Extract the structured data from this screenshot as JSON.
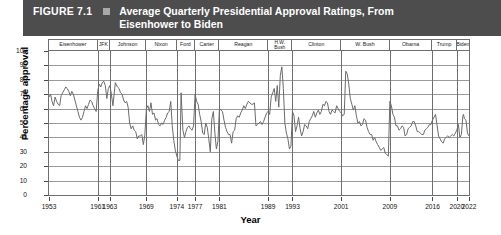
{
  "figure": {
    "number": "FIGURE 7.1",
    "marker": "square-bullet",
    "title": "Average Quarterly Presidential Approval Ratings, From Eisenhower to Biden",
    "bar_color": "#4d4d4d"
  },
  "axes": {
    "ylabel": "Percentage approval",
    "xlabel": "Year",
    "yticks": [
      100,
      90,
      80,
      70,
      60,
      50,
      40,
      30,
      20,
      10,
      0
    ],
    "ylim": [
      0,
      100
    ],
    "xticks": [
      1953,
      1961,
      1963,
      1969,
      1974,
      1977,
      1981,
      1989,
      1993,
      2001,
      2009,
      2016,
      2020,
      2022
    ],
    "xlim": [
      1953,
      2022
    ],
    "grid": "horizontal"
  },
  "presidents": [
    {
      "label": "Eisenhower",
      "start": 1953,
      "end": 1961
    },
    {
      "label": "JFK",
      "start": 1961,
      "end": 1963
    },
    {
      "label": "Johnson",
      "start": 1963,
      "end": 1969
    },
    {
      "label": "Nixon",
      "start": 1969,
      "end": 1974
    },
    {
      "label": "Ford",
      "start": 1974,
      "end": 1977
    },
    {
      "label": "Carter",
      "start": 1977,
      "end": 1981
    },
    {
      "label": "Reagan",
      "start": 1981,
      "end": 1989
    },
    {
      "label": "H.W.\nBush",
      "start": 1989,
      "end": 1993
    },
    {
      "label": "Clinton",
      "start": 1993,
      "end": 2001
    },
    {
      "label": "W. Bush",
      "start": 2001,
      "end": 2009
    },
    {
      "label": "Obama",
      "start": 2009,
      "end": 2016
    },
    {
      "label": "Trump",
      "start": 2016,
      "end": 2020
    },
    {
      "label": "Biden",
      "start": 2020,
      "end": 2022
    }
  ],
  "chart_data": {
    "type": "line",
    "title": "Average Quarterly Presidential Approval Ratings, From Eisenhower to Biden",
    "xlabel": "Year",
    "ylabel": "Percentage approval",
    "xlim": [
      1953,
      2022
    ],
    "ylim": [
      0,
      100
    ],
    "grid": true,
    "legend": "none",
    "line_color": "#6b6b6b",
    "series": [
      {
        "name": "Quarterly approval",
        "x": [
          1953.0,
          1953.25,
          1953.5,
          1953.75,
          1954.0,
          1954.25,
          1954.5,
          1954.75,
          1955.0,
          1955.25,
          1955.5,
          1955.75,
          1956.0,
          1956.25,
          1956.5,
          1956.75,
          1957.0,
          1957.25,
          1957.5,
          1957.75,
          1958.0,
          1958.25,
          1958.5,
          1958.75,
          1959.0,
          1959.25,
          1959.5,
          1959.75,
          1960.0,
          1960.25,
          1960.5,
          1960.75,
          1961.0,
          1961.25,
          1961.5,
          1961.75,
          1962.0,
          1962.25,
          1962.5,
          1962.75,
          1963.0,
          1963.25,
          1963.5,
          1963.9,
          1964.25,
          1964.5,
          1964.75,
          1965.0,
          1965.25,
          1965.5,
          1965.75,
          1966.0,
          1966.25,
          1966.5,
          1966.75,
          1967.0,
          1967.25,
          1967.5,
          1967.75,
          1968.0,
          1968.25,
          1968.5,
          1968.75,
          1969.0,
          1969.25,
          1969.5,
          1969.75,
          1970.0,
          1970.25,
          1970.5,
          1970.75,
          1971.0,
          1971.25,
          1971.5,
          1971.75,
          1972.0,
          1972.25,
          1972.5,
          1972.75,
          1973.0,
          1973.25,
          1973.5,
          1973.75,
          1974.0,
          1974.25,
          1974.5,
          1974.7,
          1975.0,
          1975.25,
          1975.5,
          1975.75,
          1976.0,
          1976.25,
          1976.5,
          1976.75,
          1977.0,
          1977.25,
          1977.5,
          1977.75,
          1978.0,
          1978.25,
          1978.5,
          1978.75,
          1979.0,
          1979.25,
          1979.5,
          1979.75,
          1980.0,
          1980.25,
          1980.5,
          1980.75,
          1981.0,
          1981.25,
          1981.5,
          1981.75,
          1982.0,
          1982.25,
          1982.5,
          1982.75,
          1983.0,
          1983.25,
          1983.5,
          1983.75,
          1984.0,
          1984.25,
          1984.5,
          1984.75,
          1985.0,
          1985.25,
          1985.5,
          1985.75,
          1986.0,
          1986.25,
          1986.5,
          1986.75,
          1987.0,
          1987.25,
          1987.5,
          1987.75,
          1988.0,
          1988.25,
          1988.5,
          1988.75,
          1989.0,
          1989.25,
          1989.5,
          1989.75,
          1990.0,
          1990.25,
          1990.5,
          1990.75,
          1991.0,
          1991.25,
          1991.5,
          1991.75,
          1992.0,
          1992.25,
          1992.5,
          1992.75,
          1993.0,
          1993.25,
          1993.5,
          1993.75,
          1994.0,
          1994.25,
          1994.5,
          1994.75,
          1995.0,
          1995.25,
          1995.5,
          1995.75,
          1996.0,
          1996.25,
          1996.5,
          1996.75,
          1997.0,
          1997.25,
          1997.5,
          1997.75,
          1998.0,
          1998.25,
          1998.5,
          1998.75,
          1999.0,
          1999.25,
          1999.5,
          1999.75,
          2000.0,
          2000.25,
          2000.5,
          2000.75,
          2001.0,
          2001.25,
          2001.5,
          2001.75,
          2002.0,
          2002.25,
          2002.5,
          2002.75,
          2003.0,
          2003.25,
          2003.5,
          2003.75,
          2004.0,
          2004.25,
          2004.5,
          2004.75,
          2005.0,
          2005.25,
          2005.5,
          2005.75,
          2006.0,
          2006.25,
          2006.5,
          2006.75,
          2007.0,
          2007.25,
          2007.5,
          2007.75,
          2008.0,
          2008.25,
          2008.5,
          2008.75,
          2009.0,
          2009.25,
          2009.5,
          2009.75,
          2010.0,
          2010.25,
          2010.5,
          2010.75,
          2011.0,
          2011.25,
          2011.5,
          2011.75,
          2012.0,
          2012.25,
          2012.5,
          2012.75,
          2013.0,
          2013.25,
          2013.5,
          2013.75,
          2014.0,
          2014.25,
          2014.5,
          2014.75,
          2015.0,
          2015.25,
          2015.5,
          2015.75,
          2016.0,
          2016.5,
          2017.0,
          2017.25,
          2017.5,
          2017.75,
          2018.0,
          2018.25,
          2018.5,
          2018.75,
          2019.0,
          2019.25,
          2019.5,
          2019.75,
          2020.0,
          2020.25,
          2020.5,
          2020.75,
          2021.0,
          2021.1,
          2021.25,
          2021.5,
          2021.75,
          2022.0
        ],
        "values": [
          68,
          70,
          65,
          62,
          68,
          65,
          63,
          62,
          69,
          71,
          73,
          75,
          74,
          72,
          69,
          72,
          70,
          66,
          62,
          58,
          54,
          52,
          54,
          58,
          62,
          60,
          63,
          66,
          65,
          62,
          60,
          58,
          72,
          77,
          75,
          78,
          79,
          76,
          67,
          74,
          76,
          70,
          62,
          78,
          75,
          74,
          71,
          70,
          66,
          64,
          65,
          61,
          50,
          46,
          48,
          45,
          44,
          39,
          41,
          41,
          42,
          35,
          42,
          60,
          62,
          58,
          64,
          56,
          57,
          52,
          53,
          49,
          48,
          50,
          49,
          52,
          54,
          57,
          58,
          65,
          48,
          38,
          31,
          27,
          24,
          24,
          71,
          45,
          40,
          44,
          47,
          48,
          46,
          45,
          48,
          70,
          65,
          63,
          56,
          51,
          43,
          42,
          50,
          47,
          39,
          30,
          53,
          58,
          43,
          32,
          37,
          60,
          59,
          58,
          52,
          47,
          44,
          42,
          42,
          36,
          44,
          45,
          53,
          55,
          54,
          57,
          59,
          62,
          60,
          63,
          65,
          64,
          63,
          63,
          64,
          48,
          49,
          50,
          51,
          49,
          51,
          54,
          57,
          58,
          56,
          68,
          71,
          74,
          65,
          76,
          61,
          83,
          89,
          74,
          50,
          43,
          39,
          32,
          34,
          58,
          55,
          44,
          48,
          54,
          46,
          41,
          44,
          49,
          48,
          46,
          51,
          53,
          55,
          58,
          54,
          57,
          59,
          56,
          58,
          63,
          62,
          65,
          64,
          58,
          56,
          59,
          58,
          57,
          62,
          60,
          58,
          57,
          55,
          56,
          86,
          84,
          77,
          67,
          63,
          59,
          62,
          55,
          50,
          51,
          48,
          49,
          53,
          52,
          47,
          44,
          42,
          42,
          38,
          40,
          37,
          35,
          33,
          31,
          32,
          33,
          29,
          28,
          27,
          65,
          62,
          56,
          54,
          48,
          48,
          45,
          46,
          48,
          47,
          41,
          42,
          46,
          47,
          48,
          51,
          51,
          48,
          44,
          44,
          43,
          42,
          42,
          45,
          46,
          47,
          49,
          49,
          52,
          56,
          41,
          39,
          37,
          36,
          39,
          40,
          41,
          40,
          41,
          42,
          41,
          43,
          45,
          49,
          40,
          42,
          55,
          56,
          53,
          52,
          43,
          41
        ]
      }
    ]
  }
}
